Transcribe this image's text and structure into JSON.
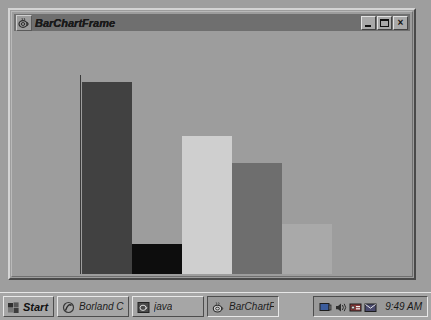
{
  "window": {
    "title": "BarChartFrame",
    "icon": "java-coffee-cup-icon",
    "controls": {
      "minimize": "_",
      "maximize": "□",
      "close": "×"
    }
  },
  "chart_data": {
    "type": "bar",
    "title": "",
    "xlabel": "",
    "ylabel": "",
    "categories": [
      "1",
      "2",
      "3",
      "4",
      "5"
    ],
    "values": [
      193,
      31,
      139,
      112,
      51
    ],
    "ylim": [
      0,
      210
    ],
    "grid": false,
    "legend": "none",
    "bar_colors": [
      "#414141",
      "#0d0d0d",
      "#cfcfcf",
      "#6e6e6e",
      "#a9a9a9"
    ],
    "axis_color": "#3a3a3a",
    "plot_background": "#9d9d9d",
    "axes": {
      "y_axis_visible": true,
      "x_axis_visible": true,
      "tick_labels_visible": false
    }
  },
  "taskbar": {
    "start": {
      "label": "Start",
      "icon": "windows-flag-icon"
    },
    "tasks": [
      {
        "label": "Borland C...",
        "icon": "borland-icon",
        "active": false
      },
      {
        "label": "java",
        "icon": "java-console-icon",
        "active": false
      },
      {
        "label": "BarChartF...",
        "icon": "java-coffee-cup-icon",
        "active": true
      }
    ],
    "tray": {
      "icons": [
        "display-icon",
        "volume-icon",
        "modem-icon",
        "mail-icon"
      ],
      "clock": "9:49 AM"
    }
  },
  "colors": {
    "desktop": "#9e9e9e",
    "window_face": "#9d9d9d",
    "titlebar_active": "#6f6f6f",
    "taskbar": "#a6a6a6"
  }
}
